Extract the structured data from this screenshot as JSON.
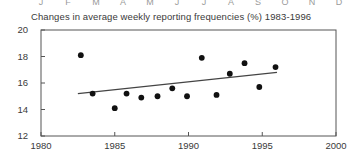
{
  "month_row": {
    "labels": [
      "J",
      "F",
      "M",
      "A",
      "M",
      "J",
      "J",
      "A",
      "S",
      "O",
      "N",
      "D"
    ],
    "positions": [
      41,
      68,
      96,
      123,
      150,
      177,
      204,
      231,
      258,
      285,
      312,
      339
    ]
  },
  "chart_data": {
    "type": "scatter",
    "title": "Changes in average weekly reporting frequencies (%) 1983-1996",
    "xlabel": "",
    "ylabel": "",
    "xlim": [
      1980,
      2000
    ],
    "ylim": [
      12,
      20
    ],
    "xticks": [
      1980,
      1985,
      1990,
      1995,
      2000
    ],
    "yticks": [
      12,
      14,
      16,
      18,
      20
    ],
    "xtick_labels": [
      "1980",
      "1985",
      "1990",
      "1995",
      "2000"
    ],
    "ytick_labels": [
      "12",
      "14",
      "16",
      "18",
      "20"
    ],
    "grid": false,
    "legend": null,
    "marker": "filled-circle",
    "marker_color": "#111111",
    "axis_color": "#555555",
    "x": [
      1982.7,
      1983.5,
      1985.0,
      1985.8,
      1986.8,
      1987.9,
      1988.9,
      1989.9,
      1990.9,
      1991.9,
      1992.8,
      1993.8,
      1994.8,
      1995.9
    ],
    "y": [
      18.1,
      15.2,
      14.1,
      15.2,
      14.9,
      15.0,
      15.6,
      15.0,
      17.9,
      15.1,
      16.7,
      17.5,
      15.7,
      17.2
    ],
    "series": [
      {
        "name": "Weekly reporting frequency",
        "type": "scatter",
        "points": [
          {
            "x": 1982.7,
            "y": 18.1
          },
          {
            "x": 1983.5,
            "y": 15.2
          },
          {
            "x": 1985.0,
            "y": 14.1
          },
          {
            "x": 1985.8,
            "y": 15.2
          },
          {
            "x": 1986.8,
            "y": 14.9
          },
          {
            "x": 1987.9,
            "y": 15.0
          },
          {
            "x": 1988.9,
            "y": 15.6
          },
          {
            "x": 1989.9,
            "y": 15.0
          },
          {
            "x": 1990.9,
            "y": 17.9
          },
          {
            "x": 1991.9,
            "y": 15.1
          },
          {
            "x": 1992.8,
            "y": 16.7
          },
          {
            "x": 1993.8,
            "y": 17.5
          },
          {
            "x": 1994.8,
            "y": 15.7
          },
          {
            "x": 1995.9,
            "y": 17.2
          }
        ]
      },
      {
        "name": "Trend line",
        "type": "line",
        "color": "#444444",
        "points": [
          {
            "x": 1982.5,
            "y": 15.2
          },
          {
            "x": 1996.0,
            "y": 16.8
          }
        ]
      }
    ]
  }
}
